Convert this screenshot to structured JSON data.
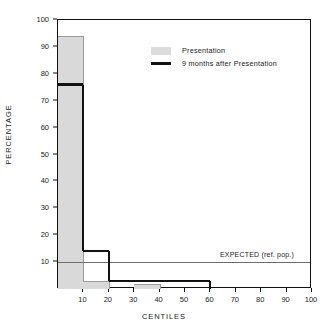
{
  "chart_data": {
    "type": "bar",
    "title": "",
    "xlabel": "CENTILES",
    "ylabel": "PERCENTAGE",
    "xlim": [
      0,
      100
    ],
    "ylim": [
      0,
      100
    ],
    "grid": false,
    "x_ticks": [
      0,
      10,
      20,
      30,
      40,
      50,
      60,
      70,
      80,
      90,
      100
    ],
    "x_tick_labels": [
      "",
      "10",
      "20",
      "30",
      "40",
      "50",
      "60",
      "70",
      "80",
      "90",
      "100"
    ],
    "y_ticks": [
      0,
      10,
      20,
      30,
      40,
      50,
      60,
      70,
      80,
      90,
      100
    ],
    "y_tick_labels": [
      "",
      "10",
      "20",
      "30",
      "40",
      "50",
      "60",
      "70",
      "80",
      "90",
      "100"
    ],
    "bin_edges": [
      0,
      10,
      20,
      30,
      40,
      50,
      60,
      70,
      80,
      90,
      100
    ],
    "series": [
      {
        "name": "Presentation",
        "style": "filled-gray-histogram",
        "color": "#d9d9d9",
        "values": [
          94,
          3,
          0,
          2,
          0,
          0,
          0,
          0,
          0,
          0
        ]
      },
      {
        "name": "9 months after Presentation",
        "style": "black-step-outline",
        "color": "#111111",
        "values": [
          76,
          14,
          3,
          3,
          3,
          3,
          0,
          0,
          0,
          0
        ]
      }
    ],
    "annotations": [
      {
        "name": "expected-reference-line",
        "text": "EXPECTED (ref. pop.)",
        "y_value": 10,
        "color": "#6f6f6f"
      }
    ],
    "legend": {
      "position": "top-right-inside",
      "entries": [
        {
          "label": "Presentation",
          "swatch": "gray-filled-rect",
          "color": "#dcdcdc"
        },
        {
          "label": "9 months after Presentation",
          "swatch": "black-line",
          "color": "#111111"
        }
      ]
    }
  },
  "axes": {
    "y_label": "PERCENTAGE",
    "x_label": "CENTILES",
    "y_tick_labels": [
      "10",
      "20",
      "30",
      "40",
      "50",
      "60",
      "70",
      "80",
      "90",
      "100"
    ],
    "x_tick_labels": [
      "10",
      "20",
      "30",
      "40",
      "50",
      "60",
      "70",
      "80",
      "90",
      "100"
    ]
  },
  "legend": {
    "presentation_label": "Presentation",
    "nine_months_label": "9 months after Presentation"
  },
  "annotation": {
    "expected_label": "EXPECTED (ref. pop.)"
  }
}
